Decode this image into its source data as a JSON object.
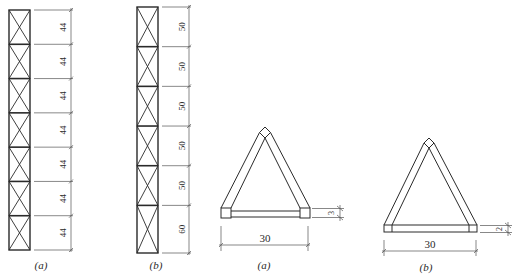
{
  "figure": {
    "mast_a": {
      "caption": "(a)",
      "panels": [
        "44",
        "44",
        "44",
        "44",
        "44",
        "44",
        "44"
      ]
    },
    "mast_b": {
      "caption": "(b)",
      "panels": [
        "50",
        "50",
        "50",
        "50",
        "50",
        "60"
      ]
    },
    "section_a": {
      "caption": "(a)",
      "width_label": "30",
      "depth_label": "3"
    },
    "section_b": {
      "caption": "(b)",
      "width_label": "30",
      "depth_label": "2"
    },
    "colors": {
      "line": "#2a2a2a",
      "dim_line": "#555555",
      "background": "#ffffff"
    }
  }
}
